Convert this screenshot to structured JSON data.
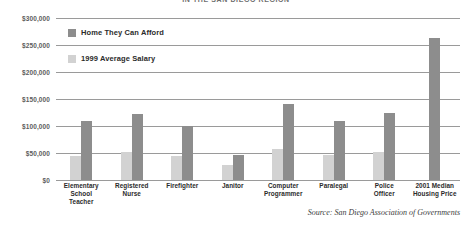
{
  "chart_data": {
    "type": "bar",
    "title": "IN THE SAN DIEGO REGION",
    "xlabel": "",
    "ylabel": "",
    "ylim": [
      0,
      300000
    ],
    "grid": true,
    "legend_position": "top-left",
    "categories": [
      "Elementary School Teacher",
      "Registered Nurse",
      "Firefighter",
      "Janitor",
      "Computer Programmer",
      "Paralegal",
      "Police Officer",
      "2001 Median Housing Price"
    ],
    "category_lines": [
      [
        "Elementary",
        "School",
        "Teacher"
      ],
      [
        "Registered",
        "Nurse"
      ],
      [
        "Firefighter"
      ],
      [
        "Janitor"
      ],
      [
        "Computer",
        "Programmer"
      ],
      [
        "Paralegal"
      ],
      [
        "Police",
        "Officer"
      ],
      [
        "2001 Median",
        "Housing Price"
      ]
    ],
    "series": [
      {
        "name": "Home They Can Afford",
        "color": "#8d8d8d",
        "values": [
          110000,
          122000,
          100000,
          47000,
          140000,
          110000,
          124000,
          263000
        ]
      },
      {
        "name": "1999 Average Salary",
        "color": "#d2d2d2",
        "values": [
          45000,
          51000,
          45000,
          28000,
          57000,
          47000,
          52000,
          null
        ]
      }
    ],
    "ytick_values": [
      300000,
      250000,
      200000,
      150000,
      100000,
      50000,
      0
    ],
    "ytick_labels": [
      "$300,000",
      "$250,000",
      "$200,000",
      "$150,000",
      "$100,000",
      "$50,000",
      "$0"
    ],
    "annotations": [
      "Source: San Diego Association of Governments"
    ]
  },
  "legend": {
    "items": [
      {
        "label": "Home They Can Afford",
        "color": "#8d8d8d"
      },
      {
        "label": "1999 Average Salary",
        "color": "#d2d2d2"
      }
    ]
  },
  "source": {
    "text": "Source: San Diego Association of Governments"
  },
  "colors": {
    "series_dark": "#8d8d8d",
    "series_light": "#d2d2d2",
    "gridline": "#9a9a9a",
    "axis_text": "#5d5d5d",
    "label_text": "#2b2b2b",
    "title_text": "#6e6e6e",
    "background": "#ffffff"
  }
}
